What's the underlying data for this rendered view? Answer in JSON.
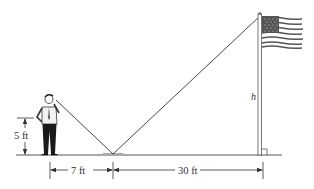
{
  "diagram": {
    "labels": {
      "person_height": "5 ft",
      "person_to_mirror": "7 ft",
      "mirror_to_pole": "30 ft",
      "pole_height": "h"
    },
    "elements": {
      "person": "man standing",
      "mirror": "mirror on ground",
      "pole": "flagpole",
      "flag": "american flag"
    },
    "colors": {
      "line": "#333333",
      "ground": "#555555",
      "mirror": "#aaaaaa"
    }
  }
}
